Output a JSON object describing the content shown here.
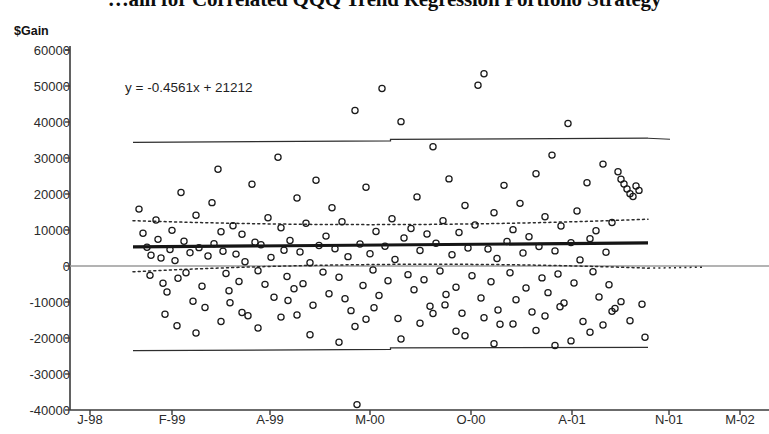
{
  "title": "…ain for Correlated QQQ Trend Regression Portfolio Strategy",
  "axes": {
    "y_title": "$Gain",
    "y_ticks": [
      "60000",
      "50000",
      "40000",
      "30000",
      "20000",
      "10000",
      "0",
      "-10000",
      "-20000",
      "-30000",
      "-40000"
    ],
    "x_ticks": [
      "J-98",
      "F-99",
      "A-99",
      "M-00",
      "O-00",
      "A-01",
      "N-01",
      "M-02"
    ]
  },
  "annotation": {
    "equation": "y = -0.4561x + 21212"
  },
  "colors": {
    "axis": "#3a3a3a",
    "point_stroke": "#1a1a1a",
    "fit_line": "#151515",
    "confidence_band": "#2b2b2b",
    "prediction_band": "#2e2e2e",
    "zero_line": "#9a9a9a",
    "background": "#ffffff"
  },
  "chart_data": {
    "type": "scatter",
    "title": "…ain for Correlated QQQ Trend Regression Portfolio Strategy",
    "xlabel": "",
    "ylabel": "$Gain",
    "xlim": [
      0,
      1600
    ],
    "ylim": [
      -40000,
      60000
    ],
    "grid": false,
    "legend": null,
    "x_tick_labels": [
      "J-98",
      "F-99",
      "A-99",
      "M-00",
      "O-00",
      "A-01",
      "N-01",
      "M-02"
    ],
    "x_tick_values": [
      0,
      400,
      800,
      1200,
      1600,
      2000,
      2400,
      2800
    ],
    "y_tick_values": [
      60000,
      50000,
      40000,
      30000,
      20000,
      10000,
      0,
      -10000,
      -20000,
      -30000,
      -40000
    ],
    "annotations": [
      {
        "text": "y = -0.4561x + 21212",
        "x": 215,
        "y": 45000
      }
    ],
    "fit_line": {
      "label": "regression fit",
      "slope_per_px": 4.2,
      "y_at_x_left": 5300,
      "y_at_x_right": 6400,
      "x_start": 133,
      "x_end": 648
    },
    "confidence_band": {
      "style": "dotted",
      "upper_left": 12600,
      "upper_mid": 10200,
      "upper_right": 13000,
      "lower_left": -1600,
      "lower_mid": 2000,
      "lower_right": -600
    },
    "prediction_band": {
      "style": "solid-thin",
      "upper_left": 34600,
      "upper_right": 35500,
      "lower_left": -23200,
      "lower_right": -22600
    },
    "zero_line": 0,
    "points": [
      [
        139,
        15800
      ],
      [
        143,
        9100
      ],
      [
        147,
        5200
      ],
      [
        151,
        3000
      ],
      [
        150,
        -2600
      ],
      [
        156,
        12800
      ],
      [
        158,
        7400
      ],
      [
        161,
        2200
      ],
      [
        163,
        -4800
      ],
      [
        167,
        -7200
      ],
      [
        170,
        4600
      ],
      [
        172,
        9900
      ],
      [
        175,
        1500
      ],
      [
        178,
        -3400
      ],
      [
        181,
        20400
      ],
      [
        184,
        6900
      ],
      [
        186,
        -1900
      ],
      [
        190,
        3700
      ],
      [
        193,
        -9800
      ],
      [
        196,
        14100
      ],
      [
        199,
        5100
      ],
      [
        202,
        -5600
      ],
      [
        205,
        -11500
      ],
      [
        208,
        2800
      ],
      [
        212,
        17600
      ],
      [
        214,
        6200
      ],
      [
        218,
        26900
      ],
      [
        221,
        9500
      ],
      [
        223,
        4100
      ],
      [
        226,
        -2100
      ],
      [
        229,
        -6900
      ],
      [
        233,
        11200
      ],
      [
        236,
        3300
      ],
      [
        239,
        -4300
      ],
      [
        242,
        8800
      ],
      [
        245,
        1200
      ],
      [
        248,
        -13800
      ],
      [
        252,
        22700
      ],
      [
        255,
        6600
      ],
      [
        258,
        -1300
      ],
      [
        261,
        5900
      ],
      [
        265,
        -5100
      ],
      [
        268,
        13400
      ],
      [
        271,
        2400
      ],
      [
        274,
        -8700
      ],
      [
        278,
        30200
      ],
      [
        281,
        10600
      ],
      [
        284,
        4400
      ],
      [
        287,
        -2900
      ],
      [
        290,
        7100
      ],
      [
        294,
        -6300
      ],
      [
        297,
        18900
      ],
      [
        300,
        3900
      ],
      [
        303,
        -4900
      ],
      [
        306,
        11900
      ],
      [
        310,
        900
      ],
      [
        313,
        -10900
      ],
      [
        316,
        23800
      ],
      [
        319,
        5700
      ],
      [
        323,
        -1700
      ],
      [
        326,
        8300
      ],
      [
        329,
        -7700
      ],
      [
        332,
        16200
      ],
      [
        335,
        4800
      ],
      [
        339,
        -3100
      ],
      [
        342,
        12300
      ],
      [
        345,
        -9100
      ],
      [
        348,
        2600
      ],
      [
        351,
        -12400
      ],
      [
        355,
        43200
      ],
      [
        357,
        -38500
      ],
      [
        360,
        6100
      ],
      [
        363,
        -5400
      ],
      [
        366,
        21900
      ],
      [
        370,
        3400
      ],
      [
        373,
        -1100
      ],
      [
        376,
        9600
      ],
      [
        379,
        -8200
      ],
      [
        382,
        49300
      ],
      [
        385,
        5500
      ],
      [
        388,
        -4100
      ],
      [
        392,
        13100
      ],
      [
        395,
        1800
      ],
      [
        398,
        -14600
      ],
      [
        401,
        40100
      ],
      [
        404,
        7800
      ],
      [
        408,
        -2400
      ],
      [
        411,
        10400
      ],
      [
        414,
        -6600
      ],
      [
        417,
        19200
      ],
      [
        420,
        4300
      ],
      [
        424,
        -3800
      ],
      [
        427,
        8900
      ],
      [
        430,
        -11200
      ],
      [
        433,
        33100
      ],
      [
        436,
        6300
      ],
      [
        440,
        -1400
      ],
      [
        443,
        12600
      ],
      [
        446,
        -7900
      ],
      [
        449,
        24200
      ],
      [
        452,
        3100
      ],
      [
        456,
        -5900
      ],
      [
        459,
        9300
      ],
      [
        462,
        -13100
      ],
      [
        465,
        16800
      ],
      [
        468,
        5000
      ],
      [
        472,
        -2700
      ],
      [
        475,
        11400
      ],
      [
        478,
        50200
      ],
      [
        481,
        -8900
      ],
      [
        484,
        53400
      ],
      [
        488,
        4700
      ],
      [
        491,
        -4400
      ],
      [
        494,
        14800
      ],
      [
        497,
        2100
      ],
      [
        500,
        -16200
      ],
      [
        504,
        22400
      ],
      [
        507,
        6800
      ],
      [
        510,
        -1900
      ],
      [
        513,
        10100
      ],
      [
        516,
        -9400
      ],
      [
        520,
        17400
      ],
      [
        523,
        3600
      ],
      [
        526,
        -6100
      ],
      [
        529,
        8100
      ],
      [
        532,
        -12800
      ],
      [
        536,
        25600
      ],
      [
        539,
        5400
      ],
      [
        542,
        -3300
      ],
      [
        545,
        13700
      ],
      [
        548,
        -7400
      ],
      [
        552,
        30800
      ],
      [
        555,
        4200
      ],
      [
        558,
        -2200
      ],
      [
        561,
        11100
      ],
      [
        564,
        -10300
      ],
      [
        568,
        39600
      ],
      [
        571,
        6500
      ],
      [
        574,
        -4700
      ],
      [
        577,
        15300
      ],
      [
        580,
        1700
      ],
      [
        583,
        -15400
      ],
      [
        587,
        23100
      ],
      [
        590,
        7600
      ],
      [
        593,
        -1600
      ],
      [
        596,
        9800
      ],
      [
        599,
        -8600
      ],
      [
        603,
        28300
      ],
      [
        606,
        3800
      ],
      [
        609,
        -5200
      ],
      [
        612,
        12100
      ],
      [
        615,
        -11800
      ],
      [
        618,
        26200
      ],
      [
        621,
        24100
      ],
      [
        624,
        22800
      ],
      [
        627,
        21400
      ],
      [
        630,
        20100
      ],
      [
        633,
        19300
      ],
      [
        636,
        22200
      ],
      [
        639,
        21000
      ],
      [
        642,
        -10600
      ],
      [
        645,
        -19800
      ],
      [
        196,
        -18600
      ],
      [
        258,
        -17200
      ],
      [
        310,
        -19100
      ],
      [
        355,
        -16800
      ],
      [
        401,
        -20300
      ],
      [
        456,
        -18100
      ],
      [
        494,
        -21600
      ],
      [
        536,
        -17900
      ],
      [
        571,
        -20800
      ],
      [
        603,
        -16400
      ],
      [
        221,
        -15400
      ],
      [
        281,
        -14200
      ],
      [
        339,
        -21200
      ],
      [
        420,
        -15900
      ],
      [
        465,
        -19400
      ],
      [
        513,
        -16100
      ],
      [
        555,
        -22100
      ],
      [
        590,
        -18400
      ],
      [
        630,
        -15200
      ],
      [
        177,
        -16600
      ],
      [
        242,
        -12900
      ],
      [
        297,
        -13600
      ],
      [
        366,
        -14800
      ],
      [
        433,
        -13200
      ],
      [
        484,
        -14400
      ],
      [
        545,
        -13900
      ],
      [
        612,
        -12600
      ],
      [
        165,
        -13400
      ],
      [
        230,
        -10200
      ],
      [
        288,
        -9600
      ],
      [
        374,
        -11600
      ],
      [
        445,
        -10800
      ],
      [
        498,
        -12200
      ],
      [
        560,
        -11300
      ],
      [
        621,
        -9900
      ]
    ]
  }
}
